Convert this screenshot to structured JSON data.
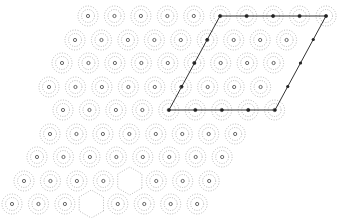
{
  "figure": {
    "colors": {
      "background": "#ffffff",
      "contour": "#8a8a8a",
      "atom": "#555555",
      "cell_line": "#333333",
      "cell_node": "#222222"
    },
    "lattice": {
      "a": 26.45,
      "row_dy": 23.5,
      "row_dx": -13.2,
      "rows": [
        {
          "y": 16,
          "x_start": 88,
          "count": 10
        },
        {
          "y": 40,
          "x_start": 75,
          "count": 9
        },
        {
          "y": 63,
          "x_start": 62,
          "count": 9
        },
        {
          "y": 87,
          "x_start": 49,
          "count": 9
        },
        {
          "y": 110,
          "x_start": 63,
          "count": 9
        },
        {
          "y": 134,
          "x_start": 50,
          "count": 8
        },
        {
          "y": 157,
          "x_start": 37,
          "count": 8
        },
        {
          "y": 181,
          "x_start": 24,
          "count": 8
        },
        {
          "y": 204,
          "x_start": 12,
          "count": 8
        }
      ]
    },
    "unit_cell": {
      "corners": [
        [
          220,
          16
        ],
        [
          326,
          16
        ],
        [
          275,
          110
        ],
        [
          169,
          110
        ]
      ],
      "edge_nodes": 4
    },
    "vacancy_at": [
      [
        134,
        181
      ],
      [
        94,
        204
      ]
    ]
  }
}
